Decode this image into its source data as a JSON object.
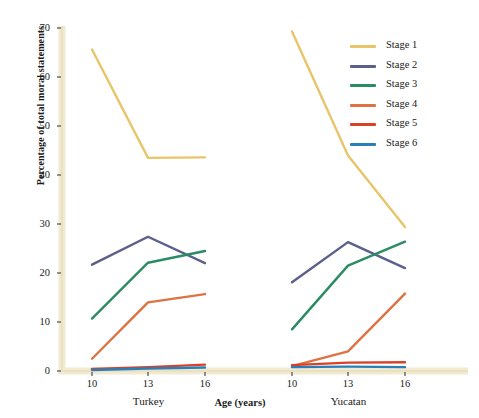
{
  "chart_data": {
    "type": "line",
    "title": "",
    "xlabel": "Age (years)",
    "ylabel": "Percentage of total moral statements",
    "ylim": [
      0,
      70
    ],
    "yticks": [
      0,
      10,
      20,
      30,
      40,
      50,
      60,
      70
    ],
    "grid": false,
    "legend_position": "top-right",
    "panels": [
      {
        "name": "Turkey",
        "x": [
          10,
          13,
          16
        ],
        "xticklabels": [
          "10",
          "13",
          "16"
        ],
        "series": [
          {
            "name": "Stage 1",
            "color": "#e9c56a",
            "values": [
              65.6,
              43.5,
              43.6
            ]
          },
          {
            "name": "Stage 2",
            "color": "#5b5f8c",
            "values": [
              21.7,
              27.4,
              22.0
            ]
          },
          {
            "name": "Stage 3",
            "color": "#2b8c63",
            "values": [
              10.7,
              22.1,
              24.5
            ]
          },
          {
            "name": "Stage 4",
            "color": "#dd7343",
            "values": [
              2.5,
              14.0,
              15.7
            ]
          },
          {
            "name": "Stage 5",
            "color": "#d94129",
            "values": [
              0.4,
              0.8,
              1.3
            ]
          },
          {
            "name": "Stage 6",
            "color": "#2b7fb8",
            "values": [
              0.2,
              0.5,
              0.7
            ]
          }
        ]
      },
      {
        "name": "Yucatan",
        "x": [
          10,
          13,
          16
        ],
        "xticklabels": [
          "10",
          "13",
          "16"
        ],
        "series": [
          {
            "name": "Stage 1",
            "color": "#e9c56a",
            "values": [
              69.3,
              44.0,
              29.4
            ]
          },
          {
            "name": "Stage 2",
            "color": "#5b5f8c",
            "values": [
              18.1,
              26.3,
              21.0
            ]
          },
          {
            "name": "Stage 3",
            "color": "#2b8c63",
            "values": [
              8.5,
              21.5,
              26.4
            ]
          },
          {
            "name": "Stage 4",
            "color": "#dd7343",
            "values": [
              1.0,
              4.0,
              15.8
            ]
          },
          {
            "name": "Stage 5",
            "color": "#d94129",
            "values": [
              1.2,
              1.7,
              1.8
            ]
          },
          {
            "name": "Stage 6",
            "color": "#2b7fb8",
            "values": [
              0.8,
              0.9,
              0.8
            ]
          }
        ]
      }
    ],
    "legend": [
      {
        "label": "Stage 1",
        "color": "#e9c56a"
      },
      {
        "label": "Stage 2",
        "color": "#5b5f8c"
      },
      {
        "label": "Stage 3",
        "color": "#2b8c63"
      },
      {
        "label": "Stage 4",
        "color": "#dd7343"
      },
      {
        "label": "Stage 5",
        "color": "#d94129"
      },
      {
        "label": "Stage 6",
        "color": "#2b7fb8"
      }
    ],
    "axis_color": "#f2ead0",
    "background": "#ffffff"
  }
}
